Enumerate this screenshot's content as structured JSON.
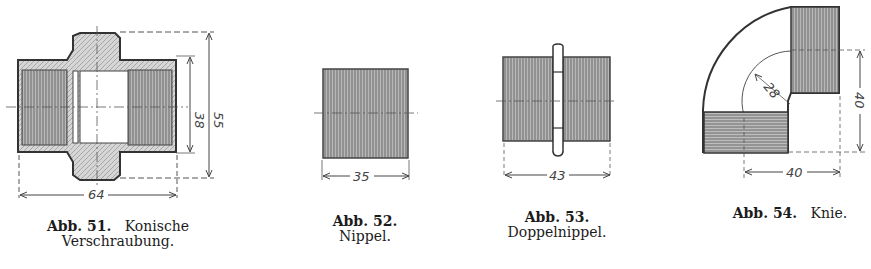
{
  "figures": [
    {
      "number": "Abb. 51.",
      "title_line1": "Konische",
      "title_line2": "Verschraubung.",
      "dimensions": {
        "width": "64",
        "inner_height": "38",
        "outer_height": "55"
      }
    },
    {
      "number": "Abb. 52.",
      "title": "Nippel.",
      "dimensions": {
        "width": "35"
      }
    },
    {
      "number": "Abb. 53.",
      "title": "Doppelnippel.",
      "dimensions": {
        "width": "43"
      }
    },
    {
      "number": "Abb. 54.",
      "title": "Knie.",
      "dimensions": {
        "radius": "28",
        "height": "40",
        "width": "40"
      }
    }
  ],
  "colors": {
    "ink": "#3a3a3a",
    "hatch": "#8a8a8a",
    "paper": "#ffffff"
  }
}
